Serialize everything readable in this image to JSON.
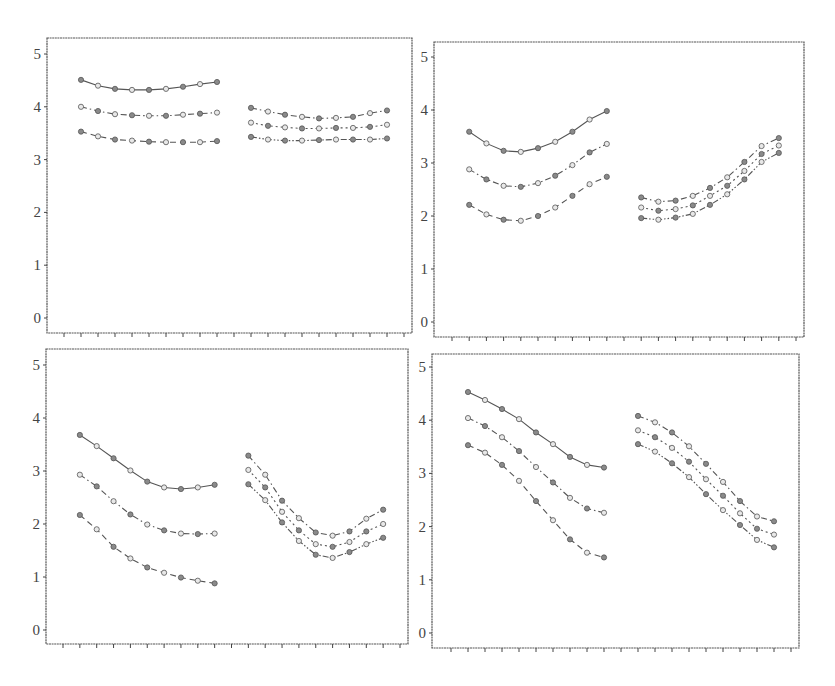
{
  "chart_data": [
    {
      "type": "line",
      "panel": "top-left",
      "title": "",
      "xlabel": "",
      "ylabel": "",
      "ylim": [
        0,
        5
      ],
      "yticks": [
        0,
        1,
        2,
        3,
        4,
        5
      ],
      "x_tick_count": 21,
      "grid": false,
      "groups": [
        {
          "x": [
            1,
            2,
            3,
            4,
            5,
            6,
            7,
            8,
            9
          ],
          "series": [
            {
              "name": "series-1",
              "style": "solid",
              "values": [
                4.51,
                4.4,
                4.34,
                4.32,
                4.32,
                4.34,
                4.38,
                4.43,
                4.47
              ]
            },
            {
              "name": "series-2",
              "style": "dashdot",
              "values": [
                4.0,
                3.92,
                3.86,
                3.84,
                3.83,
                3.83,
                3.85,
                3.87,
                3.89
              ]
            },
            {
              "name": "series-3",
              "style": "dashed",
              "values": [
                3.53,
                3.44,
                3.38,
                3.36,
                3.34,
                3.33,
                3.33,
                3.33,
                3.35
              ]
            }
          ]
        },
        {
          "x": [
            11,
            12,
            13,
            14,
            15,
            16,
            17,
            18,
            19
          ],
          "series": [
            {
              "name": "series-1",
              "style": "dashdot",
              "values": [
                3.98,
                3.91,
                3.85,
                3.81,
                3.78,
                3.79,
                3.81,
                3.88,
                3.93
              ]
            },
            {
              "name": "series-2",
              "style": "dotted",
              "values": [
                3.7,
                3.64,
                3.61,
                3.59,
                3.59,
                3.6,
                3.6,
                3.62,
                3.66
              ]
            },
            {
              "name": "series-3",
              "style": "dashdotdot",
              "values": [
                3.43,
                3.38,
                3.36,
                3.36,
                3.37,
                3.38,
                3.38,
                3.38,
                3.4
              ]
            }
          ]
        }
      ]
    },
    {
      "type": "line",
      "panel": "top-right",
      "title": "",
      "xlabel": "",
      "ylabel": "",
      "ylim": [
        0,
        5
      ],
      "yticks": [
        0,
        1,
        2,
        3,
        4,
        5
      ],
      "x_tick_count": 21,
      "grid": false,
      "groups": [
        {
          "x": [
            1,
            2,
            3,
            4,
            5,
            6,
            7,
            8,
            9
          ],
          "series": [
            {
              "name": "series-1",
              "style": "solid",
              "values": [
                3.59,
                3.37,
                3.23,
                3.21,
                3.28,
                3.4,
                3.59,
                3.82,
                3.98
              ]
            },
            {
              "name": "series-2",
              "style": "dashdot",
              "values": [
                2.88,
                2.69,
                2.57,
                2.55,
                2.62,
                2.76,
                2.96,
                3.2,
                3.36
              ]
            },
            {
              "name": "series-3",
              "style": "dashed",
              "values": [
                2.21,
                2.03,
                1.93,
                1.91,
                2.0,
                2.16,
                2.38,
                2.6,
                2.74
              ]
            }
          ]
        },
        {
          "x": [
            11,
            12,
            13,
            14,
            15,
            16,
            17,
            18,
            19
          ],
          "series": [
            {
              "name": "series-1",
              "style": "dashdot",
              "values": [
                2.35,
                2.27,
                2.29,
                2.38,
                2.53,
                2.73,
                3.02,
                3.32,
                3.47
              ]
            },
            {
              "name": "series-2",
              "style": "dotted",
              "values": [
                2.16,
                2.1,
                2.13,
                2.2,
                2.38,
                2.57,
                2.85,
                3.17,
                3.33
              ]
            },
            {
              "name": "series-3",
              "style": "dashdotdot",
              "values": [
                1.96,
                1.93,
                1.97,
                2.04,
                2.21,
                2.41,
                2.69,
                3.02,
                3.19
              ]
            }
          ]
        }
      ]
    },
    {
      "type": "line",
      "panel": "bottom-left",
      "title": "",
      "xlabel": "",
      "ylabel": "",
      "ylim": [
        0,
        5
      ],
      "yticks": [
        0,
        1,
        2,
        3,
        4,
        5
      ],
      "x_tick_count": 21,
      "grid": false,
      "groups": [
        {
          "x": [
            1,
            2,
            3,
            4,
            5,
            6,
            7,
            8,
            9
          ],
          "series": [
            {
              "name": "series-1",
              "style": "solid",
              "values": [
                3.68,
                3.47,
                3.24,
                3.01,
                2.8,
                2.69,
                2.66,
                2.69,
                2.74
              ]
            },
            {
              "name": "series-2",
              "style": "dashdot",
              "values": [
                2.93,
                2.71,
                2.43,
                2.18,
                1.99,
                1.88,
                1.82,
                1.81,
                1.82
              ]
            },
            {
              "name": "series-3",
              "style": "dashed",
              "values": [
                2.17,
                1.9,
                1.57,
                1.35,
                1.18,
                1.08,
                0.99,
                0.93,
                0.88
              ]
            }
          ]
        },
        {
          "x": [
            11,
            12,
            13,
            14,
            15,
            16,
            17,
            18,
            19
          ],
          "series": [
            {
              "name": "series-1",
              "style": "dashdot",
              "values": [
                3.29,
                2.93,
                2.44,
                2.11,
                1.84,
                1.78,
                1.86,
                2.1,
                2.27
              ]
            },
            {
              "name": "series-2",
              "style": "dotted",
              "values": [
                3.02,
                2.69,
                2.23,
                1.88,
                1.62,
                1.57,
                1.66,
                1.86,
                2.0
              ]
            },
            {
              "name": "series-3",
              "style": "dashdotdot",
              "values": [
                2.75,
                2.45,
                2.03,
                1.68,
                1.42,
                1.36,
                1.47,
                1.62,
                1.74
              ]
            }
          ]
        }
      ]
    },
    {
      "type": "line",
      "panel": "bottom-right",
      "title": "",
      "xlabel": "",
      "ylabel": "",
      "ylim": [
        0,
        5
      ],
      "yticks": [
        0,
        1,
        2,
        3,
        4,
        5
      ],
      "x_tick_count": 21,
      "grid": false,
      "groups": [
        {
          "x": [
            1,
            2,
            3,
            4,
            5,
            6,
            7,
            8,
            9
          ],
          "series": [
            {
              "name": "series-1",
              "style": "solid",
              "values": [
                4.53,
                4.38,
                4.21,
                4.02,
                3.77,
                3.55,
                3.31,
                3.16,
                3.11
              ]
            },
            {
              "name": "series-2",
              "style": "dashdot",
              "values": [
                4.04,
                3.89,
                3.68,
                3.42,
                3.12,
                2.83,
                2.54,
                2.34,
                2.26
              ]
            },
            {
              "name": "series-3",
              "style": "dashed",
              "values": [
                3.53,
                3.39,
                3.16,
                2.86,
                2.48,
                2.12,
                1.76,
                1.51,
                1.42
              ]
            }
          ]
        },
        {
          "x": [
            11,
            12,
            13,
            14,
            15,
            16,
            17,
            18,
            19
          ],
          "series": [
            {
              "name": "series-1",
              "style": "dashdot",
              "values": [
                4.08,
                3.96,
                3.77,
                3.51,
                3.18,
                2.84,
                2.48,
                2.19,
                2.1
              ]
            },
            {
              "name": "series-2",
              "style": "dotted",
              "values": [
                3.81,
                3.68,
                3.48,
                3.22,
                2.89,
                2.58,
                2.25,
                1.96,
                1.85
              ]
            },
            {
              "name": "series-3",
              "style": "dashdotdot",
              "values": [
                3.55,
                3.41,
                3.19,
                2.93,
                2.61,
                2.31,
                2.03,
                1.75,
                1.61
              ]
            }
          ]
        }
      ]
    }
  ],
  "panels_layout": [
    {
      "left": 47,
      "top": 38,
      "right": 412,
      "bottom": 333,
      "y0": 318,
      "y5": 54,
      "x_first_tick": 64
    },
    {
      "left": 434,
      "top": 42,
      "right": 804,
      "bottom": 337,
      "y0": 322,
      "y5": 57,
      "x_first_tick": 452
    },
    {
      "left": 46,
      "top": 349,
      "right": 408,
      "bottom": 644,
      "y0": 630,
      "y5": 365,
      "x_first_tick": 63
    },
    {
      "left": 432,
      "top": 354,
      "right": 799,
      "bottom": 648,
      "y0": 633,
      "y5": 367,
      "x_first_tick": 451
    }
  ]
}
